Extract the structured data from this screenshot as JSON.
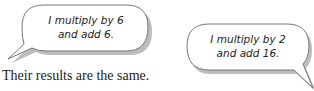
{
  "bubbles": [
    {
      "line1": "I multiply by 6",
      "line2": "and add 6."
    },
    {
      "line1": "I multiply by 2",
      "line2": "and add 16."
    }
  ],
  "caption": "Their results are the same."
}
